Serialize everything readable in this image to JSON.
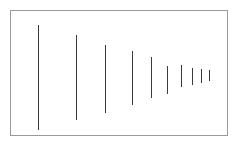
{
  "figure": {
    "background_color": "#ffffff",
    "frame": {
      "name": "plot-frame",
      "x": 10,
      "y": 10,
      "width": 218,
      "height": 126,
      "border_color": "#9a9a9a",
      "border_width": 1
    }
  },
  "chart_data": {
    "type": "bar",
    "title": "",
    "subtitle": "",
    "xlabel": "",
    "ylabel": "",
    "grid": false,
    "legend": null,
    "annotations": [],
    "orientation": "vertical",
    "series_color": "#3a3a3a",
    "line_width": 1,
    "axis_ranges": {
      "xlim": [
        0,
        10
      ],
      "ylim": [
        0,
        1
      ]
    },
    "categories": [
      "1",
      "2",
      "3",
      "4",
      "5",
      "6",
      "7",
      "8",
      "9",
      "10"
    ],
    "values": [
      105,
      85,
      68,
      54,
      41,
      28,
      22,
      17,
      14,
      11
    ],
    "x_positions": [
      38,
      76,
      105,
      132,
      151,
      167,
      181,
      192,
      201,
      209
    ],
    "segments": [
      {
        "index": 1,
        "x": 38,
        "y_top": 25,
        "y_bottom": 130,
        "length": 105
      },
      {
        "index": 2,
        "x": 76,
        "y_top": 35,
        "y_bottom": 120,
        "length": 85
      },
      {
        "index": 3,
        "x": 105,
        "y_top": 45,
        "y_bottom": 113,
        "length": 68
      },
      {
        "index": 4,
        "x": 132,
        "y_top": 51,
        "y_bottom": 105,
        "length": 54
      },
      {
        "index": 5,
        "x": 151,
        "y_top": 57,
        "y_bottom": 98,
        "length": 41
      },
      {
        "index": 6,
        "x": 167,
        "y_top": 66,
        "y_bottom": 94,
        "length": 28
      },
      {
        "index": 7,
        "x": 181,
        "y_top": 65,
        "y_bottom": 87,
        "length": 22
      },
      {
        "index": 8,
        "x": 192,
        "y_top": 68,
        "y_bottom": 85,
        "length": 17
      },
      {
        "index": 9,
        "x": 201,
        "y_top": 69,
        "y_bottom": 83,
        "length": 14
      },
      {
        "index": 10,
        "x": 209,
        "y_top": 70,
        "y_bottom": 81,
        "length": 11
      }
    ]
  }
}
